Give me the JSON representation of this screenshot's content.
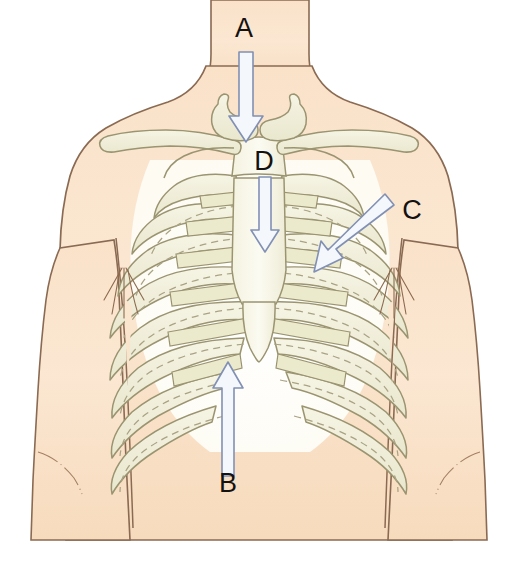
{
  "figure": {
    "name": "chest-anatomy-diagram",
    "background_color": "#ffffff"
  },
  "colors": {
    "background": "#ffffff",
    "skin_fill": "#f8dcc0",
    "skin_fill_light": "#fbe6d0",
    "skin_outline": "#8a6a52",
    "bone_fill": "#f2f0dd",
    "bone_fill_shadow": "#e4e2c6",
    "bone_outline": "#9a9471",
    "cartilage_fill": "#eceacc",
    "arrow_fill": "#f4f7fc",
    "arrow_outline": "#8190b4",
    "label_color": "#141210",
    "hair_color": "#8d6a4e"
  },
  "labels": [
    {
      "id": "label-a",
      "text": "A",
      "x": 244,
      "y": 37,
      "arrow": {
        "direction": "down",
        "description": "vertical arrow pointing down the midline of the neck toward the sternal notch",
        "from_x": 246,
        "from_y": 52,
        "to_x": 246,
        "to_y": 142
      }
    },
    {
      "id": "label-b",
      "text": "B",
      "x": 228,
      "y": 492,
      "arrow": {
        "direction": "up",
        "description": "vertical arrow pointing up from the upper abdomen toward the xiphoid process",
        "from_x": 228,
        "from_y": 476,
        "to_x": 228,
        "to_y": 362
      }
    },
    {
      "id": "label-c",
      "text": "C",
      "x": 412,
      "y": 219,
      "arrow": {
        "direction": "down-left",
        "description": "diagonal arrow pointing down and to the left toward the lateral ribs",
        "from_x": 392,
        "from_y": 200,
        "to_x": 314,
        "to_y": 272
      }
    },
    {
      "id": "label-d",
      "text": "D",
      "x": 264,
      "y": 170,
      "arrow": {
        "direction": "down",
        "description": "vertical arrow pointing down along the body of the sternum",
        "from_x": 265,
        "from_y": 177,
        "to_x": 265,
        "to_y": 252
      }
    }
  ],
  "anatomy_parts": [
    {
      "name": "neck",
      "interactable": false
    },
    {
      "name": "torso",
      "interactable": false
    },
    {
      "name": "left-arm",
      "interactable": false
    },
    {
      "name": "right-arm",
      "interactable": false
    },
    {
      "name": "clavicle-left",
      "interactable": false
    },
    {
      "name": "clavicle-right",
      "interactable": false
    },
    {
      "name": "scapula-left",
      "interactable": false
    },
    {
      "name": "scapula-right",
      "interactable": false
    },
    {
      "name": "manubrium",
      "interactable": false
    },
    {
      "name": "sternum-body",
      "interactable": false
    },
    {
      "name": "xiphoid-process",
      "interactable": false
    },
    {
      "name": "ribs-left",
      "interactable": false
    },
    {
      "name": "ribs-right",
      "interactable": false
    },
    {
      "name": "costal-cartilage",
      "interactable": false
    },
    {
      "name": "axillary-hair-left",
      "interactable": false
    },
    {
      "name": "axillary-hair-right",
      "interactable": false
    }
  ]
}
